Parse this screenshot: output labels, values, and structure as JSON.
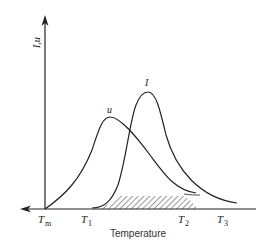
{
  "diagram": {
    "y_axis_label": "I,u",
    "x_axis_label": "Temperature",
    "curves": [
      {
        "name": "u",
        "label": "u"
      },
      {
        "name": "I",
        "label": "I"
      }
    ],
    "ticks": [
      {
        "main": "T",
        "sub": "m"
      },
      {
        "main": "T",
        "sub": "1"
      },
      {
        "main": "T",
        "sub": "2"
      },
      {
        "main": "T",
        "sub": "3"
      }
    ],
    "colors": {
      "line": "#222222",
      "hatch": "#444444"
    }
  }
}
